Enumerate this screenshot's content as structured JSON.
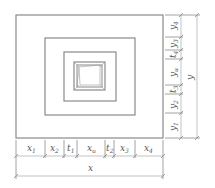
{
  "diagram": {
    "type": "nested-rectangles-dimension-drawing",
    "colors": {
      "line": "#8a8a8a",
      "text": "#555555",
      "background": "#ffffff"
    },
    "rectangles": [
      {
        "name": "outer",
        "x": 16,
        "y": 15,
        "w": 147,
        "h": 123
      },
      {
        "name": "second",
        "x": 45,
        "y": 38,
        "w": 90,
        "h": 77
      },
      {
        "name": "third",
        "x": 64,
        "y": 52,
        "w": 52,
        "h": 49
      },
      {
        "name": "core-outer",
        "x": 74,
        "y": 62,
        "w": 31,
        "h": 28
      },
      {
        "name": "core-inner",
        "x": 77,
        "y": 65,
        "w": 25,
        "h": 22
      }
    ],
    "x_dimensions": {
      "segments": [
        {
          "label": "x",
          "sub": "1",
          "from": 16,
          "to": 45
        },
        {
          "label": "x",
          "sub": "2",
          "from": 45,
          "to": 64
        },
        {
          "label": "t",
          "sub": "1",
          "from": 64,
          "to": 77
        },
        {
          "label": "x",
          "sub": "u",
          "from": 77,
          "to": 105
        },
        {
          "label": "t",
          "sub": "2",
          "from": 105,
          "to": 114
        },
        {
          "label": "x",
          "sub": "3",
          "from": 114,
          "to": 135
        },
        {
          "label": "x",
          "sub": "4",
          "from": 135,
          "to": 163
        }
      ],
      "total": {
        "label": "x"
      }
    },
    "y_dimensions": {
      "segments": [
        {
          "label": "y",
          "sub": "4",
          "from": 15,
          "to": 37
        },
        {
          "label": "y",
          "sub": "3",
          "from": 37,
          "to": 50
        },
        {
          "label": "t",
          "sub": "4",
          "from": 50,
          "to": 59
        },
        {
          "label": "y",
          "sub": "u",
          "from": 59,
          "to": 85
        },
        {
          "label": "t",
          "sub": "3",
          "from": 85,
          "to": 94
        },
        {
          "label": "y",
          "sub": "2",
          "from": 94,
          "to": 113
        },
        {
          "label": "y",
          "sub": "1",
          "from": 113,
          "to": 138
        }
      ],
      "total": {
        "label": "y"
      }
    }
  }
}
